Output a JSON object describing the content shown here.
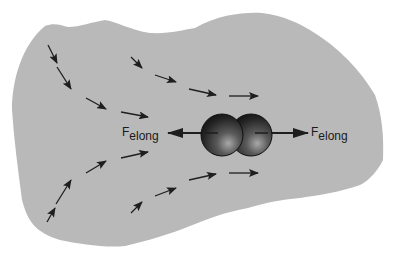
{
  "diagram": {
    "colors": {
      "fluid_region": "#b9b9b9",
      "arrow": "#1e1e1e",
      "background": "#ffffff",
      "sphere_dark": "#1a1a1a",
      "sphere_highlight": "#9a9a9a"
    },
    "force_labels": {
      "left": {
        "main": "F",
        "sub": "elong"
      },
      "right": {
        "main": "F",
        "sub": "elong"
      }
    },
    "flow_arrows": [
      {
        "x1": 48,
        "y1": 45,
        "x2": 57,
        "y2": 63
      },
      {
        "x1": 57,
        "y1": 67,
        "x2": 71,
        "y2": 89
      },
      {
        "x1": 86,
        "y1": 98,
        "x2": 106,
        "y2": 109
      },
      {
        "x1": 121,
        "y1": 112,
        "x2": 148,
        "y2": 117
      },
      {
        "x1": 131,
        "y1": 57,
        "x2": 142,
        "y2": 68
      },
      {
        "x1": 155,
        "y1": 75,
        "x2": 176,
        "y2": 82
      },
      {
        "x1": 189,
        "y1": 89,
        "x2": 216,
        "y2": 95
      },
      {
        "x1": 229,
        "y1": 96,
        "x2": 258,
        "y2": 96
      },
      {
        "x1": 47,
        "y1": 222,
        "x2": 55,
        "y2": 208
      },
      {
        "x1": 56,
        "y1": 204,
        "x2": 71,
        "y2": 180
      },
      {
        "x1": 86,
        "y1": 173,
        "x2": 106,
        "y2": 161
      },
      {
        "x1": 121,
        "y1": 158,
        "x2": 148,
        "y2": 152
      },
      {
        "x1": 131,
        "y1": 213,
        "x2": 142,
        "y2": 202
      },
      {
        "x1": 155,
        "y1": 196,
        "x2": 176,
        "y2": 188
      },
      {
        "x1": 189,
        "y1": 180,
        "x2": 216,
        "y2": 174
      },
      {
        "x1": 229,
        "y1": 173,
        "x2": 258,
        "y2": 173
      }
    ],
    "molecule": {
      "spheres": [
        {
          "cx": 222,
          "cy": 135,
          "r": 21
        },
        {
          "cx": 251,
          "cy": 135,
          "r": 21
        }
      ]
    },
    "force_arrows": [
      {
        "x1": 218,
        "y1": 133,
        "x2": 168,
        "y2": 133
      },
      {
        "x1": 255,
        "y1": 133,
        "x2": 308,
        "y2": 133
      }
    ]
  }
}
